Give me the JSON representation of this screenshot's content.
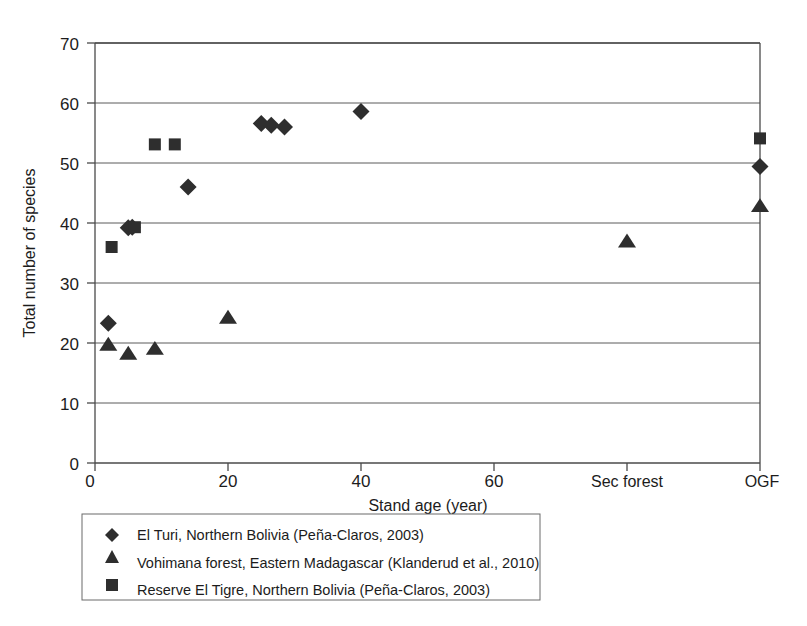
{
  "chart_data": {
    "type": "scatter",
    "title": "",
    "xlabel": "Stand age (year)",
    "ylabel": "Total number of species",
    "ylim": [
      0,
      70
    ],
    "yticks": [
      0,
      10,
      20,
      30,
      40,
      50,
      60,
      70
    ],
    "xtick_labels": [
      "0",
      "20",
      "40",
      "60",
      "Sec forest",
      "OGF"
    ],
    "xtick_values": [
      0,
      20,
      40,
      60,
      80,
      100
    ],
    "grid": "horizontal",
    "legend_position": "below-left",
    "series": [
      {
        "name": "El Turi, Northern Bolivia (Peña-Claros, 2003)",
        "marker": "diamond",
        "color": "#2e2e2e",
        "points": [
          {
            "x": 2,
            "y": 23.3
          },
          {
            "x": 5,
            "y": 39.2
          },
          {
            "x": 5.6,
            "y": 39.3
          },
          {
            "x": 14,
            "y": 46.0
          },
          {
            "x": 25,
            "y": 56.6
          },
          {
            "x": 26.5,
            "y": 56.3
          },
          {
            "x": 28.5,
            "y": 56.0
          },
          {
            "x": 40,
            "y": 58.6
          },
          {
            "x": 100,
            "y": 49.4
          }
        ]
      },
      {
        "name": "Vohimana forest, Eastern Madagascar (Klanderud et al., 2010)",
        "marker": "triangle",
        "color": "#2e2e2e",
        "points": [
          {
            "x": 2,
            "y": 19.7
          },
          {
            "x": 5,
            "y": 18.2
          },
          {
            "x": 9,
            "y": 19.0
          },
          {
            "x": 20,
            "y": 24.2
          },
          {
            "x": 80,
            "y": 36.9
          },
          {
            "x": 100,
            "y": 42.8
          }
        ]
      },
      {
        "name": "Reserve El Tigre, Northern Bolivia (Peña-Claros, 2003)",
        "marker": "square",
        "color": "#2e2e2e",
        "points": [
          {
            "x": 2.5,
            "y": 36.0
          },
          {
            "x": 6,
            "y": 39.3
          },
          {
            "x": 9,
            "y": 53.1
          },
          {
            "x": 12,
            "y": 53.1
          },
          {
            "x": 100,
            "y": 54.1
          }
        ]
      }
    ]
  },
  "axes": {
    "y_label": "Total number of species",
    "x_label": "Stand age (year)",
    "y_tick_0": "0",
    "y_tick_10": "10",
    "y_tick_20": "20",
    "y_tick_30": "30",
    "y_tick_40": "40",
    "y_tick_50": "50",
    "y_tick_60": "60",
    "y_tick_70": "70",
    "x_tick_0": "0",
    "x_tick_20": "20",
    "x_tick_40": "40",
    "x_tick_60": "60",
    "x_tick_sec": "Sec forest",
    "x_tick_ogf": "OGF"
  },
  "legend": {
    "entries": [
      {
        "label": "El Turi, Northern Bolivia (Peña-Claros, 2003)",
        "marker": "diamond"
      },
      {
        "label": "Vohimana forest, Eastern Madagascar (Klanderud et al., 2010)",
        "marker": "triangle"
      },
      {
        "label": "Reserve El Tigre, Northern Bolivia (Peña-Claros, 2003)",
        "marker": "square"
      }
    ]
  },
  "colors": {
    "marker": "#2e2e2e",
    "grid": "#5a5a5a",
    "frame": "#4a4a4a",
    "text": "#1c1c1c",
    "background": "#ffffff"
  }
}
